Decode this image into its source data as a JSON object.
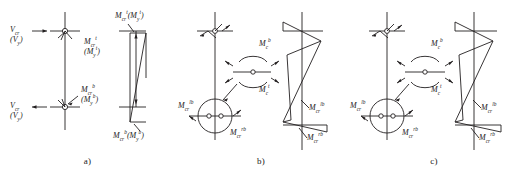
{
  "figure": {
    "type": "structural-engineering-diagram",
    "stroke_color": "#231f20",
    "background_color": "#ffffff",
    "panels": [
      {
        "id": "a",
        "caption": "a)",
        "labels": {
          "shear_top_main": "V",
          "shear_top_sub": "cr",
          "shear_top_alt": "(V",
          "shear_top_alt_sub": "y",
          "shear_top_alt_close": ")",
          "shear_bottom_main": "V",
          "shear_bottom_sub": "cr",
          "shear_bottom_alt": "(V",
          "shear_bottom_alt_sub": "y",
          "shear_bottom_alt_close": ")",
          "moment_top_main": "M",
          "moment_top_sub": "cr",
          "moment_top_sup": "t",
          "moment_top_alt": "(M",
          "moment_top_alt_sub": "y",
          "moment_top_alt_sup": "t",
          "moment_top_alt_close": ")",
          "moment_bottom_main": "M",
          "moment_bottom_sub": "cr",
          "moment_bottom_sup": "b",
          "moment_bottom_alt": "(M",
          "moment_bottom_alt_sub": "y",
          "moment_bottom_alt_sup": "b",
          "moment_bottom_alt_close": ")",
          "bmd_top_main": "M",
          "bmd_top_sub": "cr",
          "bmd_top_sup": "t",
          "bmd_top_alt": "(M",
          "bmd_top_alt_sub": "y",
          "bmd_top_alt_sup": "t",
          "bmd_top_alt_close": ")",
          "bmd_bottom_main": "M",
          "bmd_bottom_sub": "cr",
          "bmd_bottom_sup": "b",
          "bmd_bottom_alt": "(M",
          "bmd_bottom_alt_sub": "y",
          "bmd_bottom_alt_sup": "b",
          "bmd_bottom_alt_close": ")"
        }
      },
      {
        "id": "b",
        "caption": "b)",
        "labels": {
          "beam_top_main": "M",
          "beam_top_sub": "c",
          "beam_top_sup": "b",
          "beam_bottom_main": "M",
          "beam_bottom_sub": "c",
          "beam_bottom_sup": "t",
          "col_left_main": "M",
          "col_left_sub": "cr",
          "col_left_sup": "lb",
          "col_right_main": "M",
          "col_right_sub": "cr",
          "col_right_sup": "rb",
          "bmd_upper_main": "M",
          "bmd_upper_sub": "cr",
          "bmd_upper_sup": "lb",
          "bmd_lower_main": "M",
          "bmd_lower_sub": "cr",
          "bmd_lower_sup": "rb"
        }
      },
      {
        "id": "c",
        "caption": "c)",
        "labels": {
          "beam_top_main": "M",
          "beam_top_sub": "c",
          "beam_top_sup": "b",
          "beam_bottom_main": "M",
          "beam_bottom_sub": "c",
          "beam_bottom_sup": "t",
          "col_left_main": "M",
          "col_left_sub": "cr",
          "col_left_sup": "lb",
          "col_right_main": "M",
          "col_right_sub": "cr",
          "col_right_sup": "rb",
          "bmd_upper_main": "M",
          "bmd_upper_sub": "cr",
          "bmd_upper_sup": "lb",
          "bmd_lower_main": "M",
          "bmd_lower_sub": "cr",
          "bmd_lower_sup": "rb"
        }
      }
    ]
  }
}
